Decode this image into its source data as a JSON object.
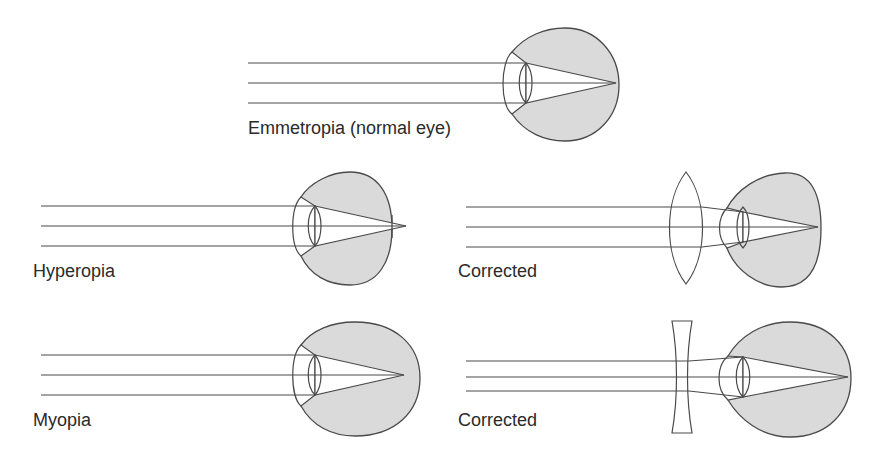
{
  "figure": {
    "colors": {
      "line": "#4a4a4a",
      "eye_fill": "#dadada",
      "background": "#ffffff",
      "text": "#2a2a2a"
    },
    "panels": [
      {
        "id": "emmetropia",
        "label": "Emmetropia (normal eye)",
        "focus": "on retina",
        "corrective_lens": "none"
      },
      {
        "id": "hyperopia",
        "label": "Hyperopia",
        "focus": "behind retina",
        "corrective_lens": "none"
      },
      {
        "id": "hyperopia-corrected",
        "label": "Corrected",
        "focus": "on retina",
        "corrective_lens": "convex"
      },
      {
        "id": "myopia",
        "label": "Myopia",
        "focus": "in front of retina",
        "corrective_lens": "none"
      },
      {
        "id": "myopia-corrected",
        "label": "Corrected",
        "focus": "on retina",
        "corrective_lens": "concave"
      }
    ]
  }
}
